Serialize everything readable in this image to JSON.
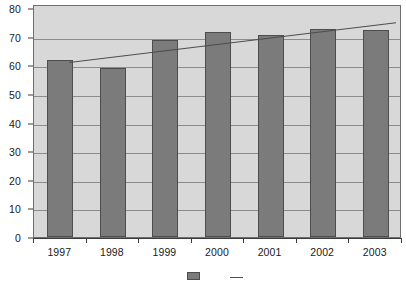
{
  "chart_data": {
    "type": "bar",
    "title": "",
    "subtitle": "",
    "xlabel": "",
    "ylabel": "",
    "categories": [
      "1997",
      "1998",
      "1999",
      "2000",
      "2001",
      "2002",
      "2003"
    ],
    "values": [
      62,
      59,
      69,
      71.5,
      70.5,
      72.5,
      72.3
    ],
    "ylim": [
      0,
      80
    ],
    "ytick_labels": [
      "0",
      "10",
      "20",
      "30",
      "40",
      "50",
      "60",
      "70",
      "80"
    ],
    "ytick_values": [
      0,
      10,
      20,
      30,
      40,
      50,
      60,
      70,
      80
    ],
    "grid": true,
    "legend_position": "bottom",
    "series": [
      {
        "name": "Bars",
        "type": "bar",
        "color": "#7b7b7b",
        "values": [
          62,
          59,
          69,
          71.5,
          70.5,
          72.5,
          72.3
        ]
      },
      {
        "name": "Trend",
        "type": "line",
        "color": "#4d4d4d",
        "start_value": 61.5,
        "end_value": 75.5
      }
    ],
    "annotations": []
  },
  "colors": {
    "bar_fill": "#7b7b7b",
    "bar_border": "#4d4d4d",
    "plot_background": "#d8d8d8",
    "gridline": "#8c8c8c",
    "axis": "#3a3a3a",
    "text": "#1a1a1a",
    "page_background": "#ffffff"
  },
  "legend": {
    "entries": [
      {
        "label": "",
        "swatch": "bar-swatch"
      },
      {
        "label": "",
        "swatch": "line-swatch"
      }
    ]
  }
}
